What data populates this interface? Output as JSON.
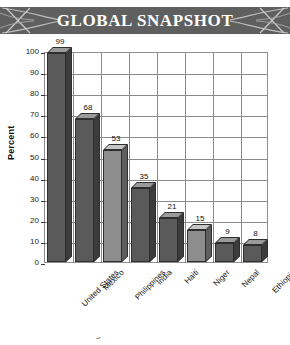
{
  "header": {
    "title": "GLOBAL SNAPSHOT",
    "background_color": "#5f5f5f",
    "text_color": "#ffffff",
    "ornament_left": "crossed-curves-decoration",
    "ornament_right": "crossed-curves-decoration"
  },
  "caption": {
    "partial_text": "s"
  },
  "chart_data": {
    "type": "bar",
    "title": "GLOBAL SNAPSHOT",
    "xlabel": "",
    "ylabel": "Percent",
    "ylim": [
      0,
      100
    ],
    "ytick_step": 10,
    "yticks": [
      "0",
      "10",
      "20",
      "30",
      "40",
      "50",
      "60",
      "70",
      "80",
      "90",
      "100"
    ],
    "grid": true,
    "legend": "none",
    "style": "3d-bars",
    "categories": [
      "United States",
      "Mexico",
      "Philippines",
      "India",
      "Haiti",
      "Niger",
      "Nepal",
      "Ethiopia"
    ],
    "values": [
      99,
      68,
      53,
      35,
      21,
      15,
      9,
      8
    ],
    "bar_shades": [
      "dark",
      "dark",
      "light",
      "dark",
      "dark",
      "light",
      "dark",
      "dark"
    ],
    "colors": {
      "bar_front_dark": "#5a5a5a",
      "bar_top_dark": "#9a9a9a",
      "bar_side_dark": "#3b3b3b",
      "bar_front_light": "#8d8d8d",
      "bar_top_light": "#c6c6c6",
      "bar_side_light": "#5e5e5e",
      "grid": "#8a8a8a",
      "axis": "#3a3a3a",
      "text": "#111111"
    }
  }
}
